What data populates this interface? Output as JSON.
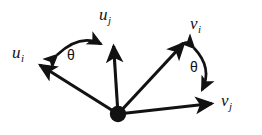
{
  "figure": {
    "name": "vector-angle-diagram",
    "background_color": "#ffffff",
    "ink_color": "#121212",
    "origin": {
      "x": 118,
      "y": 114
    }
  },
  "labels": {
    "u_i": {
      "base": "u",
      "sub": "i"
    },
    "u_j": {
      "base": "u",
      "sub": "j"
    },
    "v_i": {
      "base": "v",
      "sub": "i"
    },
    "v_j": {
      "base": "v",
      "sub": "j"
    },
    "theta_left": "θ",
    "theta_right": "θ"
  },
  "vectors": [
    {
      "name": "u_i",
      "label": "u_i",
      "from": {
        "x": 118,
        "y": 114
      },
      "to": {
        "x": 36,
        "y": 62
      },
      "arrowhead": "filled-triangle"
    },
    {
      "name": "u_j",
      "label": "u_j",
      "from": {
        "x": 118,
        "y": 114
      },
      "to": {
        "x": 113,
        "y": 41
      },
      "arrowhead": "filled-triangle"
    },
    {
      "name": "v_i",
      "label": "v_i",
      "from": {
        "x": 118,
        "y": 114
      },
      "to": {
        "x": 188,
        "y": 38
      },
      "arrowhead": "filled-triangle"
    },
    {
      "name": "v_j",
      "label": "v_j",
      "from": {
        "x": 118,
        "y": 114
      },
      "to": {
        "x": 217,
        "y": 104
      },
      "arrowhead": "filled-triangle"
    }
  ],
  "angle_arcs": [
    {
      "name": "theta-left",
      "label": "θ",
      "between": [
        "u_i",
        "u_j"
      ],
      "style": "double-headed-curved-arrow",
      "start": {
        "x": 52,
        "y": 58
      },
      "end": {
        "x": 106,
        "y": 42
      }
    },
    {
      "name": "theta-right",
      "label": "θ",
      "between": [
        "v_i",
        "v_j"
      ],
      "style": "double-headed-curved-arrow",
      "start": {
        "x": 195,
        "y": 44
      },
      "end": {
        "x": 204,
        "y": 95
      }
    }
  ]
}
